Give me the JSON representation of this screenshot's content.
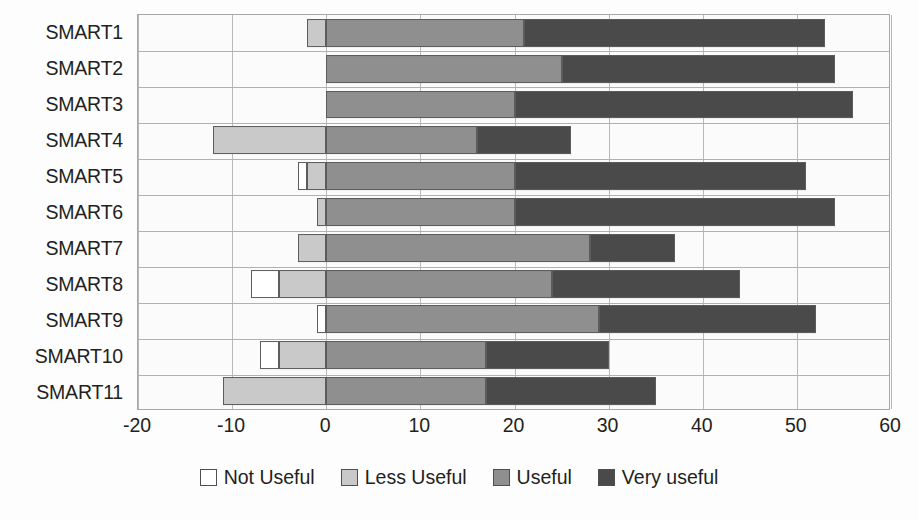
{
  "chart_data": {
    "type": "bar",
    "orientation": "horizontal",
    "stacked": true,
    "diverging": true,
    "title": "",
    "xlabel": "",
    "ylabel": "",
    "xlim": [
      -20,
      60
    ],
    "xticks": [
      -20,
      -10,
      0,
      10,
      20,
      30,
      40,
      50,
      60
    ],
    "xtick_labels": [
      "-20",
      "-10",
      "0",
      "10",
      "20",
      "30",
      "40",
      "50",
      "60"
    ],
    "grid": true,
    "legend_position": "bottom",
    "categories": [
      "SMART1",
      "SMART2",
      "SMART3",
      "SMART4",
      "SMART5",
      "SMART6",
      "SMART7",
      "SMART8",
      "SMART9",
      "SMART10",
      "SMART11"
    ],
    "series": [
      {
        "name": "Not Useful",
        "color": "#ffffff",
        "values": [
          0,
          0,
          0,
          0,
          -1,
          0,
          0,
          -3,
          -1,
          -2,
          0
        ]
      },
      {
        "name": "Less Useful",
        "color": "#c9c9c9",
        "values": [
          -2,
          0,
          0,
          -12,
          -2,
          -1,
          -3,
          -5,
          0,
          -5,
          -11
        ]
      },
      {
        "name": "Useful",
        "color": "#8f8f8f",
        "values": [
          21,
          25,
          20,
          16,
          20,
          20,
          28,
          24,
          29,
          17,
          17
        ]
      },
      {
        "name": "Very useful",
        "color": "#4a4a4a",
        "values": [
          32,
          29,
          36,
          10,
          31,
          34,
          9,
          20,
          23,
          13,
          18
        ]
      }
    ],
    "cumulative_positive_ends": [
      53,
      54,
      56,
      26,
      51,
      54,
      37,
      44,
      52,
      30,
      35
    ],
    "legend_entries": [
      "Not Useful",
      "Less Useful",
      "Useful",
      "Very useful"
    ]
  }
}
